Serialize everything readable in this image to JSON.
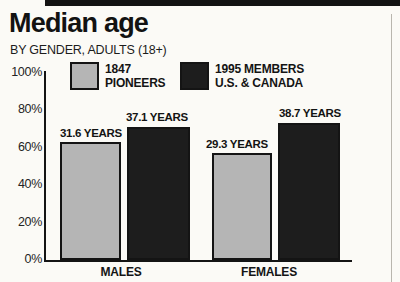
{
  "header": {
    "title": "Median age",
    "subtitle": "BY GENDER, ADULTS (18+)"
  },
  "legend": {
    "items": [
      {
        "line1": "1847",
        "line2": "PIONEERS",
        "color": "#b5b5b5"
      },
      {
        "line1": "1995 MEMBERS",
        "line2": "U.S. & CANADA",
        "color": "#1d1d1d"
      }
    ]
  },
  "chart_data": {
    "type": "bar",
    "title": "Median age",
    "subtitle": "BY GENDER, ADULTS (18+)",
    "categories": [
      "MALES",
      "FEMALES"
    ],
    "series": [
      {
        "name": "1847 PIONEERS",
        "values": [
          31.6,
          29.3
        ],
        "unit": "years",
        "bar_labels": [
          "31.6 YEARS",
          "29.3 YEARS"
        ],
        "display_height_pct": [
          62.8,
          56.9
        ],
        "color": "#b5b5b5",
        "border_color": "#141414"
      },
      {
        "name": "1995 MEMBERS U.S. & CANADA",
        "values": [
          37.1,
          38.7
        ],
        "unit": "years",
        "bar_labels": [
          "37.1 YEARS",
          "38.7 YEARS"
        ],
        "display_height_pct": [
          70.7,
          72.9
        ],
        "color": "#1d1d1d",
        "border_color": "#141414"
      }
    ],
    "xlabel": "",
    "ylabel": "",
    "y_ticks": [
      "100%",
      "80%",
      "60%",
      "40%",
      "20%",
      "0%"
    ],
    "ylim": [
      0,
      100
    ],
    "grid": false,
    "legend_position": "top-inside"
  }
}
